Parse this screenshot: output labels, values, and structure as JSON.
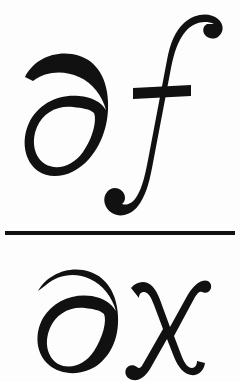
{
  "image": {
    "kind": "mathematical-expression",
    "notation": "partial-derivative",
    "expression": "∂f/∂x",
    "plain_text": "partial f over partial x",
    "latex": "\\frac{\\partial f}{\\partial x}",
    "width_px": 240,
    "height_px": 382,
    "background_color": "#fdfdfd",
    "ink_color": "#111111",
    "style": "calligraphic-italic-serif"
  },
  "fraction": {
    "numerator": {
      "label": "numerator",
      "text": "∂f",
      "symbols": [
        {
          "name": "partial-differential-symbol",
          "character": "∂",
          "unicode": "U+2202",
          "spoken": "partial"
        },
        {
          "name": "variable-f",
          "character": "f",
          "unicode": "U+0066",
          "spoken": "f"
        }
      ]
    },
    "bar": {
      "label": "fraction-bar",
      "character": "—",
      "thickness_px": 4,
      "x_start_px": 5,
      "x_end_px": 235,
      "y_px": 233,
      "color": "#111111"
    },
    "denominator": {
      "label": "denominator",
      "text": "∂x",
      "symbols": [
        {
          "name": "partial-differential-symbol",
          "character": "∂",
          "unicode": "U+2202",
          "spoken": "partial"
        },
        {
          "name": "variable-x",
          "character": "x",
          "unicode": "U+0078",
          "spoken": "x"
        }
      ]
    }
  }
}
